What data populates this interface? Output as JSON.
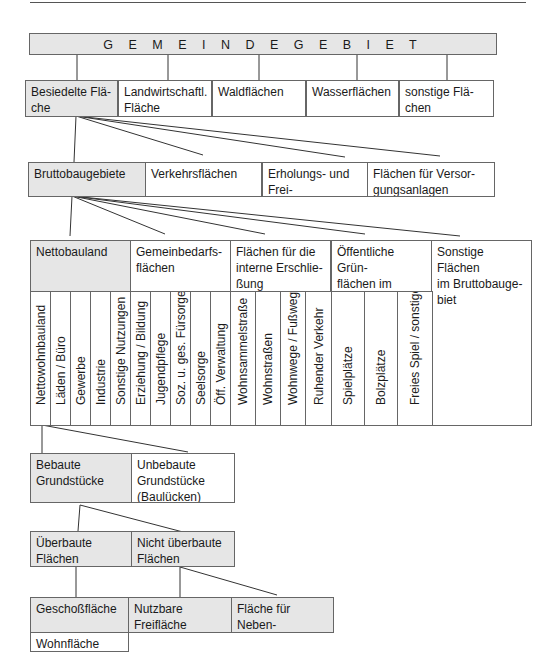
{
  "diagram": {
    "root": {
      "label": "G E M E I N D E G E B I E T"
    },
    "level1": [
      {
        "label": "Besiedelte Flä-\nche",
        "shaded": true
      },
      {
        "label": "Landwirtschaftl.\nFläche",
        "shaded": false
      },
      {
        "label": "Waldflächen",
        "shaded": false
      },
      {
        "label": "Wasserflächen",
        "shaded": false
      },
      {
        "label": "sonstige Flä-\nchen",
        "shaded": false
      }
    ],
    "level2": [
      {
        "label": "Bruttobaugebiete",
        "shaded": true
      },
      {
        "label": "Verkehrsflächen",
        "shaded": false
      },
      {
        "label": "Erholungs- und Frei-\nflächen",
        "shaded": false
      },
      {
        "label": "Flächen für Versor-\ngungsanlagen",
        "shaded": false
      }
    ],
    "level3": [
      {
        "label": "Nettobauland",
        "shaded": true,
        "children": [
          "Nettowohnbauland",
          "Läden / Büro",
          "Gewerbe",
          "Industrie",
          "Sonstige Nutzungen"
        ]
      },
      {
        "label": "Gemeinbedarfs-\nflächen",
        "shaded": false,
        "children": [
          "Erziehung / Bildung",
          "Jugendpflege",
          "Soz. u. ges. Fürsorge",
          "Seelsorge",
          "Öff. Verwaltung"
        ]
      },
      {
        "label": "Flächen für die\ninterne Erschlie-\nßung",
        "shaded": false,
        "children": [
          "Wohnsammelstraße",
          "Wohnstraßen",
          "Wohnwege / Fußwege",
          "Ruhender Verkehr"
        ]
      },
      {
        "label": "Öffentliche Grün-\nflächen im Brutto-\nbaugebiet",
        "shaded": false,
        "children": [
          "Spielplätze",
          "Bolzplätze",
          "Freies Spiel / sonstiges"
        ]
      },
      {
        "label": "Sonstige Flächen\nim Bruttobauge-\nbiet",
        "shaded": false,
        "children": []
      }
    ],
    "level4": [
      {
        "label": "Bebaute\nGrundstücke",
        "shaded": true
      },
      {
        "label": "Unbebaute\nGrundstücke\n(Baulücken)",
        "shaded": false
      }
    ],
    "level5": [
      {
        "label": "Überbaute\nFlächen",
        "shaded": true
      },
      {
        "label": "Nicht überbaute\nFlächen",
        "shaded": true
      }
    ],
    "level6": [
      {
        "label": "Geschoßfläche",
        "shaded": true
      },
      {
        "label": "Nutzbare\nFreifläche",
        "shaded": true
      },
      {
        "label": "Fläche für Neben-\nanlagen",
        "shaded": true
      }
    ],
    "level7": [
      {
        "label": "Wohnfläche",
        "shaded": false
      }
    ]
  }
}
